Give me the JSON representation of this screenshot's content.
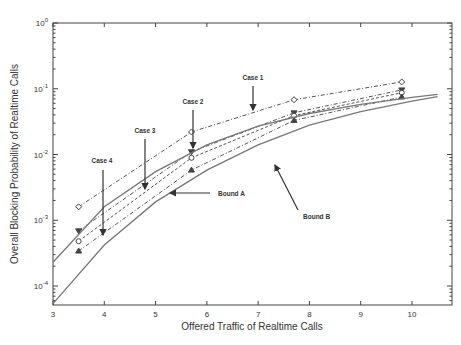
{
  "chart_data": {
    "type": "line",
    "title": "",
    "xlabel": "Offered Traffic of Realtime Calls",
    "ylabel": "Overall Blocking Probability of Realtime Calls",
    "xlim": [
      3,
      10.5
    ],
    "ylim": [
      5e-05,
      1
    ],
    "yscale": "log",
    "grid": false,
    "x_ticks": [
      3,
      4,
      5,
      6,
      7,
      8,
      9,
      10
    ],
    "y_ticks": [
      {
        "value": 1,
        "label": "10^0"
      },
      {
        "value": 0.1,
        "label": "10^-1"
      },
      {
        "value": 0.01,
        "label": "10^-2"
      },
      {
        "value": 0.001,
        "label": "10^-3"
      },
      {
        "value": 0.0001,
        "label": "10^-4"
      }
    ],
    "series": [
      {
        "name": "Case 1",
        "marker": "diamond",
        "style": "dash-dot",
        "x": [
          3.5,
          5.7,
          7.7,
          9.8
        ],
        "values": [
          0.0016,
          0.022,
          0.068,
          0.127
        ]
      },
      {
        "name": "Case 2",
        "marker": "triangle-down",
        "style": "dash-dot",
        "x": [
          3.5,
          5.7,
          7.7,
          9.8
        ],
        "values": [
          0.00069,
          0.011,
          0.043,
          0.096
        ]
      },
      {
        "name": "Case 3",
        "marker": "circle",
        "style": "dashed",
        "x": [
          3.5,
          5.7,
          7.7,
          9.8
        ],
        "values": [
          0.00048,
          0.0089,
          0.039,
          0.087
        ]
      },
      {
        "name": "Case 4",
        "marker": "triangle-up",
        "style": "dash-dot",
        "x": [
          3.5,
          5.7,
          7.7,
          9.8
        ],
        "values": [
          0.00034,
          0.0058,
          0.033,
          0.075
        ]
      },
      {
        "name": "Bound B",
        "marker": "none",
        "style": "solid",
        "x": [
          3,
          4,
          5,
          6,
          7,
          8,
          9,
          10,
          10.5
        ],
        "values": [
          0.00023,
          0.0016,
          0.0055,
          0.014,
          0.027,
          0.042,
          0.058,
          0.074,
          0.082
        ]
      },
      {
        "name": "Bound A",
        "marker": "none",
        "style": "solid",
        "x": [
          3,
          4,
          5,
          6,
          7,
          8,
          9,
          10,
          10.5
        ],
        "values": [
          5.4e-05,
          0.00042,
          0.0019,
          0.0058,
          0.014,
          0.028,
          0.045,
          0.065,
          0.076
        ]
      }
    ],
    "annotations": [
      {
        "text": "Case 1",
        "x": 6.95,
        "points_to": "Case 1"
      },
      {
        "text": "Case 2",
        "x": 5.8,
        "points_to": "Case 2"
      },
      {
        "text": "Case 3",
        "x": 4.8,
        "points_to": "Case 3"
      },
      {
        "text": "Case 4",
        "x": 4.0,
        "points_to": "Case 4"
      },
      {
        "text": "Bound A",
        "x": 5.25,
        "points_to": "Bound A"
      },
      {
        "text": "Bound B",
        "x": 7.3,
        "points_to": "Bound B"
      }
    ]
  }
}
